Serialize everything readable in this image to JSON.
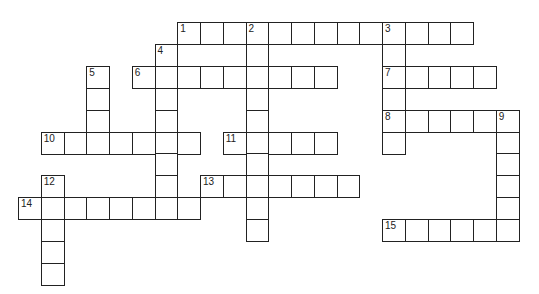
{
  "puzzle": {
    "grid": {
      "origin_x": 18,
      "origin_y": 22,
      "cell_w": 22.75,
      "cell_h": 21.9
    },
    "entries": [
      {
        "number": "1",
        "direction": "across",
        "row": 0,
        "col": 7,
        "length": 13
      },
      {
        "number": "2",
        "direction": "down",
        "row": 0,
        "col": 10,
        "length": 10
      },
      {
        "number": "3",
        "direction": "down",
        "row": 0,
        "col": 16,
        "length": 6
      },
      {
        "number": "4",
        "direction": "down",
        "row": 1,
        "col": 6,
        "length": 8
      },
      {
        "number": "5",
        "direction": "down",
        "row": 2,
        "col": 3,
        "length": 4
      },
      {
        "number": "6",
        "direction": "across",
        "row": 2,
        "col": 5,
        "length": 9
      },
      {
        "number": "7",
        "direction": "across",
        "row": 2,
        "col": 16,
        "length": 5
      },
      {
        "number": "8",
        "direction": "across",
        "row": 4,
        "col": 16,
        "length": 6
      },
      {
        "number": "9",
        "direction": "down",
        "row": 4,
        "col": 21,
        "length": 6
      },
      {
        "number": "10",
        "direction": "across",
        "row": 5,
        "col": 1,
        "length": 7
      },
      {
        "number": "11",
        "direction": "across",
        "row": 5,
        "col": 9,
        "length": 5
      },
      {
        "number": "12",
        "direction": "down",
        "row": 7,
        "col": 1,
        "length": 5
      },
      {
        "number": "13",
        "direction": "across",
        "row": 7,
        "col": 8,
        "length": 7
      },
      {
        "number": "14",
        "direction": "across",
        "row": 8,
        "col": 0,
        "length": 8
      },
      {
        "number": "15",
        "direction": "across",
        "row": 9,
        "col": 16,
        "length": 6
      }
    ]
  }
}
